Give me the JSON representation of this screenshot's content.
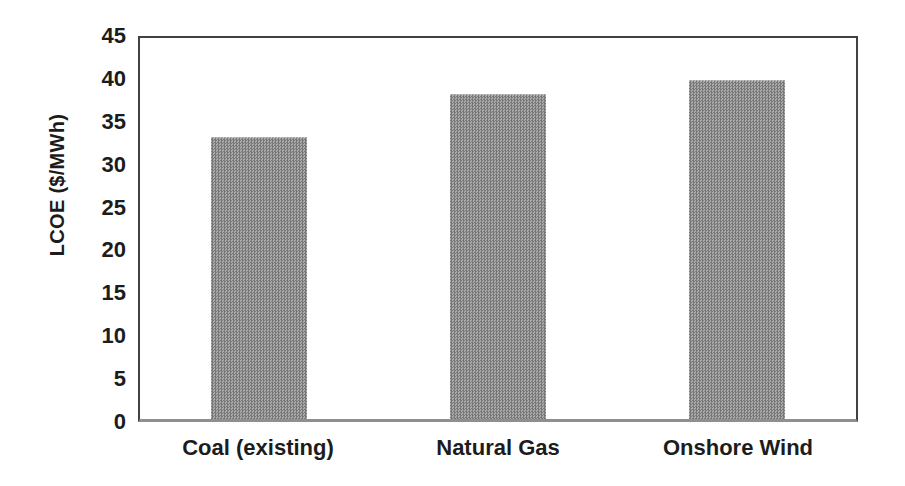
{
  "window": {
    "background": "#ffffff"
  },
  "chart_data": {
    "type": "bar",
    "title": "",
    "categories": [
      "Coal (existing)",
      "Natural Gas",
      "Onshore Wind"
    ],
    "values": [
      33.3,
      38.4,
      40.1
    ],
    "xlabel": "",
    "ylabel": "LCOE ($/MWh)",
    "ylim": [
      0,
      45
    ],
    "yticks": [
      0,
      5,
      10,
      15,
      20,
      25,
      30,
      35,
      40,
      45
    ],
    "grid": false,
    "legend": "none",
    "colors": {
      "bar": "#919191",
      "bar_halftone_dark": "#787878",
      "bar_halftone_light": "#ababab",
      "plot_border": "#414141",
      "x_axis_line": "#8f8f8f",
      "text": "#1c1c1c",
      "background": "#ffffff"
    }
  }
}
